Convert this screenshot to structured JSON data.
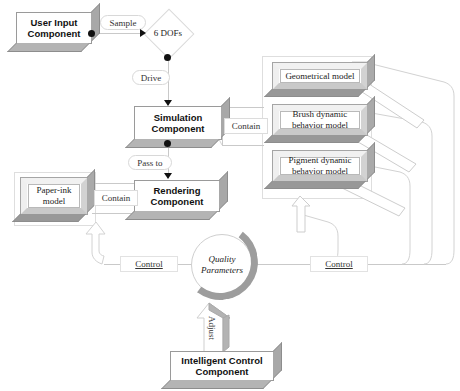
{
  "diagram": {
    "components": {
      "user_input": "User Input\nComponent",
      "user_input_line1": "User Input",
      "user_input_line2": "Component",
      "simulation_line1": "Simulation",
      "simulation_line2": "Component",
      "rendering_line1": "Rendering",
      "rendering_line2": "Component",
      "intelligent_line1": "Intelligent Control",
      "intelligent_line2": "Component"
    },
    "decision": {
      "dofs": "6 DOFs"
    },
    "models": {
      "geometrical": "Geometrical model",
      "brush_line1": "Brush dynamic",
      "brush_line2": "behavior model",
      "pigment_line1": "Pigment dynamic",
      "pigment_line2": "behavior model",
      "paper_ink_line1": "Paper-ink",
      "paper_ink_line2": "model"
    },
    "state": {
      "quality_line1": "Quality",
      "quality_line2": "Parameters"
    },
    "edge_labels": {
      "sample": "Sample",
      "drive": "Drive",
      "pass_to": "Pass to",
      "contain_models": "Contain",
      "contain_paper": "Contain",
      "control_left": "Control",
      "control_right": "Control",
      "adjust": "Adjust"
    },
    "colors": {
      "box_fill": "#ffffff",
      "extrude_right": "#a8a8a8",
      "extrude_bottom": "#b4b4b4",
      "line": "#c9c9c9",
      "arrow_fill": "#111111",
      "frame_border": "#dedede",
      "text": "#111111"
    }
  }
}
